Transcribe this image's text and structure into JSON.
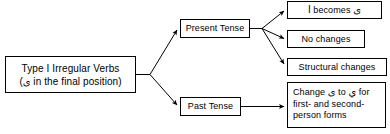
{
  "diagram": {
    "colors": {
      "background": "#ffffff",
      "border": "#000000",
      "text": "#000000",
      "arrow": "#000000"
    },
    "root": {
      "line1": "Type I Irregular Verbs",
      "line2_prefix": "(",
      "line2_arabic": "ى",
      "line2_suffix": " in the final position)"
    },
    "branches": [
      {
        "id": "present",
        "label": "Present Tense",
        "children": [
          {
            "id": "alef-becomes-ya",
            "prefix": "ا",
            "label": " becomes ",
            "suffix": "ى"
          },
          {
            "id": "no-changes",
            "label": "No changes"
          },
          {
            "id": "structural-changes",
            "label": "Structural changes"
          }
        ]
      },
      {
        "id": "past",
        "label": "Past Tense",
        "children": [
          {
            "id": "change-ya-to-ya",
            "part1": "Change ",
            "arabic1": "ى",
            "part2": " to ",
            "arabic2": "ي",
            "part3": " for first- and second-person forms"
          }
        ]
      }
    ]
  }
}
